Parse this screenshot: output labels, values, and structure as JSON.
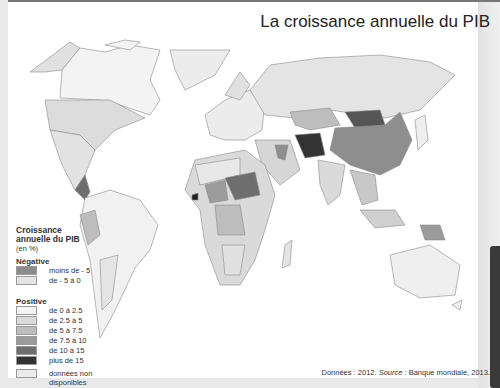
{
  "title": "La croissance annuelle du PIB",
  "legend": {
    "title_line1": "Croissance",
    "title_line2": "annuelle du PIB",
    "unit": "(en %)",
    "negative_heading": "Négative",
    "negative": [
      {
        "label": "moins de - 5",
        "color": "#8c8c8c"
      },
      {
        "label": "de - 5 à  0",
        "color": "#e4e4e4"
      }
    ],
    "positive_heading": "Positive",
    "positive": [
      {
        "label": "de 0 à 2.5",
        "color": "#f4f4f4"
      },
      {
        "label": "de 2.5 à 5",
        "color": "#dadada"
      },
      {
        "label": "de 5 à 7.5",
        "color": "#bdbdbd"
      },
      {
        "label": "de 7.5 à 10",
        "color": "#9b9b9b"
      },
      {
        "label": "de 10 à 15",
        "color": "#6e6e6e"
      },
      {
        "label": "plus de 15",
        "color": "#333333"
      }
    ],
    "na": {
      "label_line1": "données non",
      "label_line2": "disponibles",
      "color": "#ececec"
    }
  },
  "source_prefix": "Données : 2012. ",
  "source_label": "Source",
  "source_text": " : Banque mondiale, 2013."
}
